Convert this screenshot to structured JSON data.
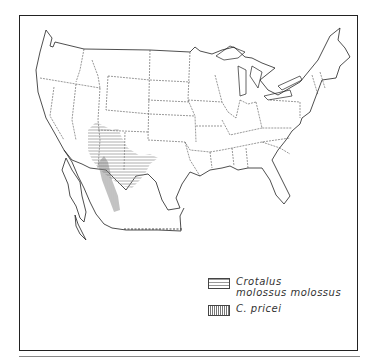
{
  "map": {
    "region": "Contiguous United States and northern Mexico",
    "legend": {
      "items": [
        {
          "label_line1": "Crotalus",
          "label_line2": "molossus molossus",
          "pattern": "horizontal-hatch"
        },
        {
          "label_line1": "C. pricei",
          "label_line2": "",
          "pattern": "vertical-hatch"
        }
      ]
    },
    "colors": {
      "outline": "#222222",
      "hatch_molossus": "#999999",
      "hatch_pricei": "#777777",
      "background": "#ffffff"
    }
  }
}
